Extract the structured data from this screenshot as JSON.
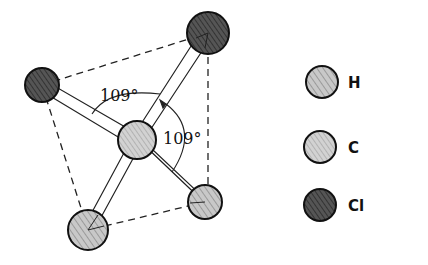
{
  "diagram": {
    "angle_labels": [
      {
        "text": "109°",
        "x": 100,
        "y": 101
      },
      {
        "text": "109°",
        "x": 163,
        "y": 144
      }
    ],
    "atoms": [
      {
        "element": "Cl",
        "cx": 208,
        "cy": 33,
        "r": 21
      },
      {
        "element": "Cl",
        "cx": 42,
        "cy": 85,
        "r": 17
      },
      {
        "element": "C",
        "cx": 137,
        "cy": 140,
        "r": 19
      },
      {
        "element": "H",
        "cx": 88,
        "cy": 230,
        "r": 20
      },
      {
        "element": "H",
        "cx": 205,
        "cy": 202,
        "r": 17
      }
    ],
    "colors": {
      "H": "#b5b5b5",
      "C": "#c4c4c4",
      "Cl": "#4a4a4a",
      "outline": "#111111"
    }
  },
  "legend": {
    "items": [
      {
        "label": "H",
        "element": "H"
      },
      {
        "label": "C",
        "element": "C"
      },
      {
        "label": "Cl",
        "element": "Cl"
      }
    ]
  }
}
